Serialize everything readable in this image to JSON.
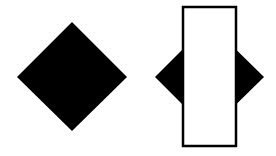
{
  "diagram": {
    "background": "#ffffff",
    "shapes": [
      {
        "id": "solid-diamond",
        "type": "diamond",
        "fill": "#000000",
        "points": [
          [
            72,
            22
          ],
          [
            127,
            77
          ],
          [
            72,
            131
          ],
          [
            17,
            77
          ]
        ]
      },
      {
        "id": "occluded-diamond",
        "type": "diamond",
        "fill": "#000000",
        "points": [
          [
            209,
            23
          ],
          [
            264,
            77
          ],
          [
            209,
            131
          ],
          [
            155,
            77
          ]
        ]
      },
      {
        "id": "white-rectangle",
        "type": "rectangle",
        "fill": "#ffffff",
        "stroke": "#000000",
        "stroke_width": 2.5,
        "x": 183,
        "y": 7,
        "width": 53,
        "height": 139
      }
    ]
  }
}
